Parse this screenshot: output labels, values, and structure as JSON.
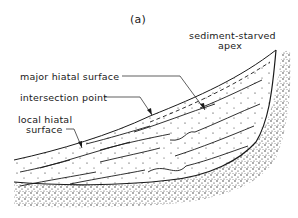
{
  "figure": {
    "panel_label": "(a)",
    "labels": {
      "apex_line1": "sediment-starved",
      "apex_line2": "apex",
      "major": "major hiatal surface",
      "intersection": "intersection point",
      "local_line1": "local hiatal",
      "local_line2": "surface"
    },
    "colors": {
      "ink": "#1a1a1a",
      "background": "#ffffff"
    }
  }
}
